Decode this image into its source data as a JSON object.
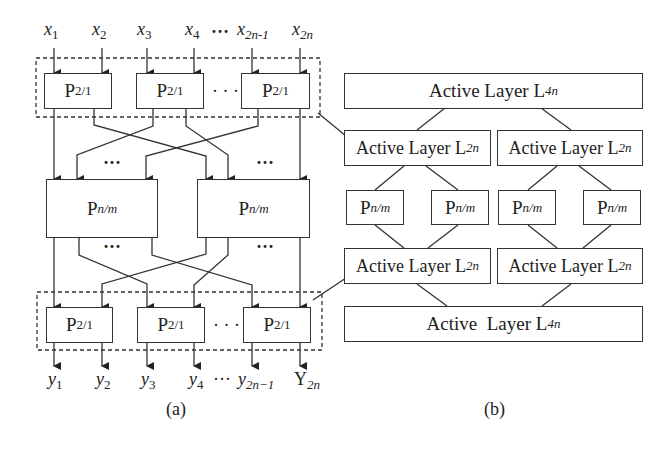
{
  "panel_a": {
    "caption": "(a)",
    "inputs": [
      {
        "base": "x",
        "sub": "1"
      },
      {
        "base": "x",
        "sub": "2"
      },
      {
        "base": "x",
        "sub": "3"
      },
      {
        "base": "x",
        "sub": "4"
      },
      {
        "base": "x",
        "sub": "2n-1"
      },
      {
        "base": "x",
        "sub": "2n"
      }
    ],
    "input_ellipsis": "…",
    "top_stage": {
      "boxes": [
        {
          "base": "P",
          "sub": "2/1"
        },
        {
          "base": "P",
          "sub": "2/1"
        },
        {
          "base": "P",
          "sub": "2/1"
        }
      ],
      "ellipsis": "· · ·"
    },
    "middle_stage": {
      "boxes": [
        {
          "base": "P",
          "sub": "n/m"
        },
        {
          "base": "P",
          "sub": "n/m"
        }
      ],
      "ellipsis": "· · ·"
    },
    "bottom_stage": {
      "boxes": [
        {
          "base": "P",
          "sub": "2/1"
        },
        {
          "base": "P",
          "sub": "2/1"
        },
        {
          "base": "P",
          "sub": "2/1"
        }
      ],
      "ellipsis": "· · ·"
    },
    "outputs": [
      {
        "base": "y",
        "sub": "1"
      },
      {
        "base": "y",
        "sub": "2"
      },
      {
        "base": "y",
        "sub": "3"
      },
      {
        "base": "y",
        "sub": "4"
      },
      {
        "base": "y",
        "sub": "2n−1"
      },
      {
        "base": "Y",
        "sub": "2n"
      }
    ],
    "output_ellipsis": "···"
  },
  "panel_b": {
    "caption": "(b)",
    "layers": {
      "top": {
        "text": "Active Layer L",
        "sub": "4n"
      },
      "upper_left": {
        "text": "Active Layer L",
        "sub": "2n"
      },
      "upper_right": {
        "text": "Active Layer L",
        "sub": "2n"
      },
      "modules": [
        {
          "base": "P",
          "sub": "n/m"
        },
        {
          "base": "P",
          "sub": "n/m"
        },
        {
          "base": "P",
          "sub": "n/m"
        },
        {
          "base": "P",
          "sub": "n/m"
        }
      ],
      "lower_left": {
        "text": "Active Layer L",
        "sub": "2n"
      },
      "lower_right": {
        "text": "Active Layer L",
        "sub": "2n"
      },
      "bottom": {
        "text": "Active  Layer L",
        "sub": "4n"
      }
    }
  },
  "colors": {
    "stroke": "#333333",
    "background": "#ffffff"
  }
}
